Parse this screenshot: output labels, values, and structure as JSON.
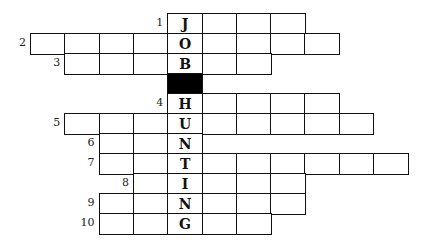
{
  "puzzle": {
    "type": "crossword",
    "theme_word": "JOB HUNTING",
    "grid": {
      "origin_x": 30,
      "origin_y": 13,
      "cell_w": 34.3,
      "cell_h": 20,
      "key_column": 4
    },
    "rows": [
      {
        "number": "1",
        "start_col": 4,
        "length": 4,
        "key_letter": "J"
      },
      {
        "number": "2",
        "start_col": 0,
        "length": 9,
        "key_letter": "O"
      },
      {
        "number": "3",
        "start_col": 1,
        "length": 6,
        "key_letter": "B"
      },
      {
        "number": "",
        "start_col": 4,
        "length": 1,
        "key_letter": "",
        "black": true
      },
      {
        "number": "4",
        "start_col": 4,
        "length": 5,
        "key_letter": "H"
      },
      {
        "number": "5",
        "start_col": 1,
        "length": 9,
        "key_letter": "U"
      },
      {
        "number": "6",
        "start_col": 2,
        "length": 3,
        "key_letter": "N"
      },
      {
        "number": "7",
        "start_col": 2,
        "length": 9,
        "key_letter": "T"
      },
      {
        "number": "8",
        "start_col": 3,
        "length": 5,
        "key_letter": "I"
      },
      {
        "number": "9",
        "start_col": 2,
        "length": 6,
        "key_letter": "N"
      },
      {
        "number": "10",
        "start_col": 2,
        "length": 5,
        "key_letter": "G"
      }
    ]
  }
}
